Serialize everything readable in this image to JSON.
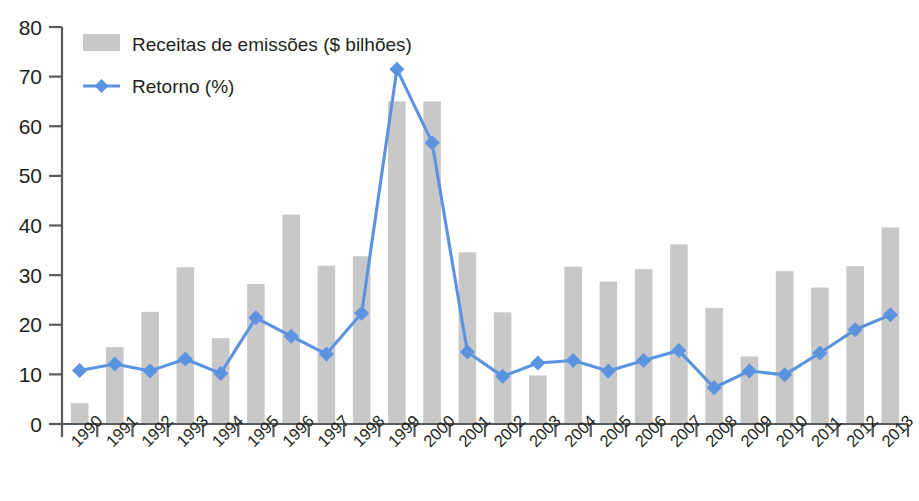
{
  "chart_data": {
    "type": "bar",
    "title": "",
    "subtitle": "",
    "xlabel": "",
    "ylabel": "",
    "ylim": [
      0,
      80
    ],
    "ytick_step": 10,
    "yticks": [
      "0",
      "10",
      "20",
      "30",
      "40",
      "50",
      "60",
      "70",
      "80"
    ],
    "grid": false,
    "legend_position": "top-left",
    "categories": [
      "1990",
      "1991",
      "1992",
      "1993",
      "1994",
      "1995",
      "1996",
      "1997",
      "1998",
      "1999",
      "2000",
      "2001",
      "2002",
      "2003",
      "2004",
      "2005",
      "2006",
      "2007",
      "2008",
      "2009",
      "2010",
      "2011",
      "2012",
      "2013"
    ],
    "series": [
      {
        "name": "Receitas de emissões ($ bilhões)",
        "type": "bar",
        "color": "#c8c8c8",
        "values": [
          4.2,
          15.5,
          22.6,
          31.6,
          17.3,
          28.2,
          42.2,
          31.9,
          33.8,
          65.0,
          65.0,
          34.6,
          22.5,
          9.8,
          31.7,
          28.7,
          31.2,
          36.2,
          23.4,
          13.6,
          30.8,
          27.5,
          31.8,
          39.6
        ]
      },
      {
        "name": "Retorno (%)",
        "type": "line",
        "color": "#5b93e0",
        "values": [
          10.8,
          12.1,
          10.7,
          13.1,
          10.2,
          21.4,
          17.7,
          14.1,
          22.3,
          71.5,
          56.7,
          14.5,
          9.6,
          12.3,
          12.8,
          10.7,
          12.8,
          14.8,
          7.3,
          10.7,
          9.9,
          14.3,
          19.0,
          22.0
        ]
      }
    ]
  },
  "legend": {
    "items": [
      {
        "label": "Receitas de emissões ($ bilhões)",
        "swatch": "bar-swatch"
      },
      {
        "label": "Retorno (%)",
        "swatch": "line-marker-swatch"
      }
    ]
  },
  "colors": {
    "bar": "#c8c8c8",
    "line": "#5b93e0",
    "axis": "#58595b",
    "text": "#231f20",
    "background": "#ffffff"
  }
}
